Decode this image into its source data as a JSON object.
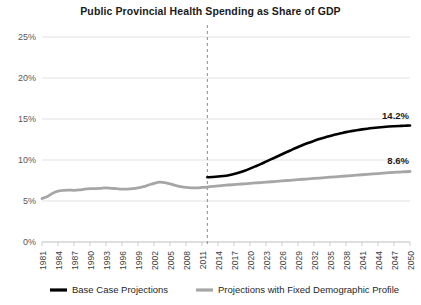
{
  "chart_data": {
    "type": "line",
    "title": "Public Provincial Health Spending as Share of GDP",
    "xlabel": "",
    "ylabel": "",
    "ylim": [
      0,
      25
    ],
    "xlim": [
      1981,
      2050
    ],
    "ytick_labels": [
      "25%",
      "20%",
      "15%",
      "10%",
      "5%",
      "0%"
    ],
    "ytick_values": [
      25,
      20,
      15,
      10,
      5,
      0
    ],
    "xtick_labels": [
      "1981",
      "1984",
      "1987",
      "1990",
      "1993",
      "1996",
      "1999",
      "2002",
      "2005",
      "2008",
      "2011",
      "2014",
      "2017",
      "2020",
      "2023",
      "2026",
      "2029",
      "2032",
      "2035",
      "2038",
      "2041",
      "2044",
      "2047",
      "2050"
    ],
    "xtick_values": [
      1981,
      1984,
      1987,
      1990,
      1993,
      1996,
      1999,
      2002,
      2005,
      2008,
      2011,
      2014,
      2017,
      2020,
      2023,
      2026,
      2029,
      2032,
      2035,
      2038,
      2041,
      2044,
      2047,
      2050
    ],
    "grid": true,
    "legend_position": "bottom",
    "divider_year": 2012,
    "annotations": [
      {
        "label": "14.2%",
        "year": 2050,
        "value": 14.2,
        "series": "Base Case Projections"
      },
      {
        "label": "8.6%",
        "year": 2050,
        "value": 8.6,
        "series": "Projections with Fixed Demographic Profile"
      }
    ],
    "series": [
      {
        "name": "Base Case Projections",
        "color": "#000000",
        "width": 2.6,
        "x": [
          2012,
          2013,
          2014,
          2015,
          2016,
          2017,
          2018,
          2019,
          2020,
          2021,
          2022,
          2023,
          2024,
          2025,
          2026,
          2027,
          2028,
          2029,
          2030,
          2031,
          2032,
          2033,
          2034,
          2035,
          2036,
          2037,
          2038,
          2039,
          2040,
          2041,
          2042,
          2043,
          2044,
          2045,
          2046,
          2047,
          2048,
          2049,
          2050
        ],
        "values": [
          7.9,
          7.93,
          7.98,
          8.05,
          8.15,
          8.3,
          8.48,
          8.7,
          8.95,
          9.22,
          9.5,
          9.8,
          10.1,
          10.4,
          10.7,
          11.0,
          11.3,
          11.58,
          11.85,
          12.1,
          12.33,
          12.55,
          12.75,
          12.93,
          13.1,
          13.25,
          13.4,
          13.52,
          13.63,
          13.73,
          13.82,
          13.9,
          13.97,
          14.03,
          14.08,
          14.12,
          14.15,
          14.18,
          14.2
        ]
      },
      {
        "name": "Projections with Fixed Demographic Profile",
        "color": "#a6a6a6",
        "width": 2.8,
        "x": [
          1981,
          1982,
          1983,
          1984,
          1985,
          1986,
          1987,
          1988,
          1989,
          1990,
          1991,
          1992,
          1993,
          1994,
          1995,
          1996,
          1997,
          1998,
          1999,
          2000,
          2001,
          2002,
          2003,
          2004,
          2005,
          2006,
          2007,
          2008,
          2009,
          2010,
          2011,
          2012,
          2013,
          2014,
          2015,
          2016,
          2017,
          2018,
          2019,
          2020,
          2021,
          2022,
          2023,
          2024,
          2025,
          2026,
          2027,
          2028,
          2029,
          2030,
          2031,
          2032,
          2033,
          2034,
          2035,
          2036,
          2037,
          2038,
          2039,
          2040,
          2041,
          2042,
          2043,
          2044,
          2045,
          2046,
          2047,
          2048,
          2049,
          2050
        ],
        "values": [
          5.3,
          5.55,
          5.95,
          6.2,
          6.3,
          6.33,
          6.3,
          6.35,
          6.45,
          6.5,
          6.5,
          6.55,
          6.6,
          6.55,
          6.5,
          6.45,
          6.45,
          6.5,
          6.6,
          6.75,
          6.95,
          7.15,
          7.3,
          7.25,
          7.1,
          6.9,
          6.75,
          6.65,
          6.6,
          6.6,
          6.65,
          6.7,
          6.78,
          6.85,
          6.9,
          6.95,
          7.0,
          7.05,
          7.1,
          7.15,
          7.2,
          7.25,
          7.3,
          7.35,
          7.4,
          7.45,
          7.5,
          7.55,
          7.6,
          7.65,
          7.7,
          7.75,
          7.8,
          7.85,
          7.9,
          7.95,
          8.0,
          8.05,
          8.1,
          8.15,
          8.2,
          8.25,
          8.3,
          8.35,
          8.4,
          8.45,
          8.5,
          8.53,
          8.57,
          8.6
        ]
      }
    ],
    "historical_series_note": "gray line is continuous 1981-2050; black begins at 2012"
  },
  "legend": {
    "items": [
      {
        "label": "Base Case Projections",
        "color": "#000000"
      },
      {
        "label": "Projections with Fixed Demographic Profile",
        "color": "#a6a6a6"
      }
    ]
  }
}
